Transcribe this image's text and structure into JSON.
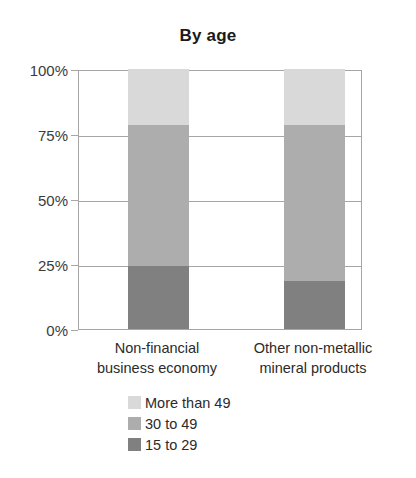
{
  "chart_data": {
    "type": "bar",
    "subtype": "stacked-percentage-column",
    "title": "By age",
    "xlabel": "",
    "ylabel": "",
    "ylim": [
      0,
      100
    ],
    "yunit": "%",
    "ytick_labels": [
      "100%",
      "75%",
      "50%",
      "25%",
      "0%"
    ],
    "ytick_values": [
      100,
      75,
      50,
      25,
      0
    ],
    "grid": true,
    "legend_position": "bottom",
    "categories": [
      "Non-financial\nbusiness economy",
      "Other non-metallic\nmineral products"
    ],
    "category_lines": [
      [
        "Non-financial",
        "business economy"
      ],
      [
        "Other non-metallic",
        "mineral products"
      ]
    ],
    "series": [
      {
        "name": "More than 49",
        "color": "#d9d9d9",
        "values": [
          21.5,
          21.5
        ]
      },
      {
        "name": "30 to 49",
        "color": "#adadad",
        "values": [
          54.3,
          60.0
        ]
      },
      {
        "name": "15 to 29",
        "color": "#808080",
        "values": [
          24.2,
          18.5
        ]
      }
    ],
    "stack_order_bottom_to_top": [
      "15 to 29",
      "30 to 49",
      "More than 49"
    ]
  },
  "legend": {
    "items": [
      {
        "label": "More than 49",
        "color": "#d9d9d9"
      },
      {
        "label": "30 to 49",
        "color": "#adadad"
      },
      {
        "label": "15 to 29",
        "color": "#808080"
      }
    ]
  },
  "axis": {
    "y_ticks": [
      {
        "label": "100%",
        "value": 100
      },
      {
        "label": "75%",
        "value": 75
      },
      {
        "label": "50%",
        "value": 50
      },
      {
        "label": "25%",
        "value": 25
      },
      {
        "label": "0%",
        "value": 0
      }
    ]
  },
  "colors": {
    "axis": "#a6a6a6",
    "text": "#2b2b2b",
    "title": "#1a1a1a",
    "background": "#ffffff"
  }
}
